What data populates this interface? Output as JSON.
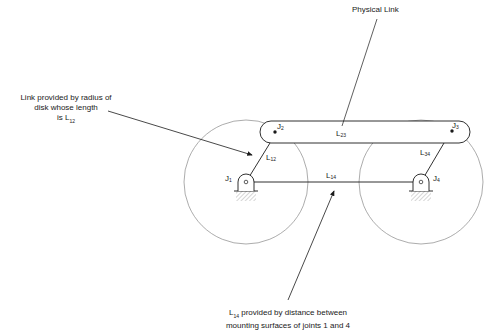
{
  "annotations": {
    "physical_link": "Physical Link",
    "radius_link_line1": "Link provided by radius of",
    "radius_link_line2": "disk whose length",
    "radius_link_line3_prefix": "is L",
    "radius_link_line3_sub": "12",
    "ground_link_line1_prefix": "L",
    "ground_link_line1_sub": "14",
    "ground_link_line1_suffix": " provided by distance between",
    "ground_link_line2": "mounting surfaces of joints 1 and 4"
  },
  "joints": [
    {
      "id": "J1",
      "base": "J",
      "sub": "1"
    },
    {
      "id": "J2",
      "base": "J",
      "sub": "2"
    },
    {
      "id": "J3",
      "base": "J",
      "sub": "3"
    },
    {
      "id": "J4",
      "base": "J",
      "sub": "4"
    }
  ],
  "links": [
    {
      "id": "L12",
      "base": "L",
      "sub": "12"
    },
    {
      "id": "L23",
      "base": "L",
      "sub": "23"
    },
    {
      "id": "L34",
      "base": "L",
      "sub": "34"
    },
    {
      "id": "L14",
      "base": "L",
      "sub": "14"
    }
  ],
  "colors": {
    "line": "#1a1a1a",
    "circle": "#777777",
    "hatch": "#999999",
    "background": "#ffffff"
  }
}
